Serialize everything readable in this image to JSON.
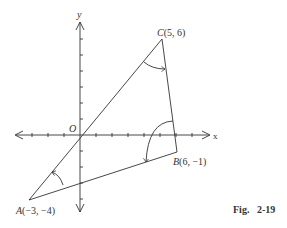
{
  "figure": {
    "caption": "Fig.   2-19",
    "axes": {
      "x_label": "x",
      "y_label": "y",
      "origin_label": "O",
      "x_ticks": [
        -4,
        -3,
        -2,
        -1,
        1,
        2,
        3,
        4,
        5,
        6,
        7
      ],
      "y_ticks": [
        -5,
        -4,
        -3,
        -2,
        -1,
        1,
        2,
        3,
        4,
        5,
        6
      ]
    },
    "points": [
      {
        "name": "A",
        "coords": "(−3, −4)",
        "x": -3,
        "y": -4
      },
      {
        "name": "B",
        "coords": "(6, −1)",
        "x": 6,
        "y": -1
      },
      {
        "name": "C",
        "coords": "(5, 6)",
        "x": 5,
        "y": 6
      }
    ],
    "angles": [
      "angle-A",
      "angle-B",
      "angle-C"
    ],
    "colors": {
      "stroke": "#333333",
      "background": "#ffffff"
    }
  }
}
